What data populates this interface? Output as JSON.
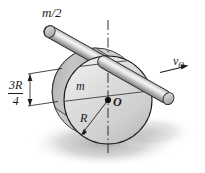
{
  "figure": {
    "name": "rolling-disk-with-rod-diagram",
    "width": 205,
    "height": 173,
    "background_color": "#ffffff"
  },
  "labels": {
    "rod_mass": "m/2",
    "disk_mass": "m",
    "center_point": "O",
    "radius": "R",
    "velocity_symbol": "v",
    "velocity_subscript": "O",
    "offset_numerator": "3R",
    "offset_denominator": "4"
  },
  "colors": {
    "disk_face": "#d3d3d3",
    "disk_face_light": "#e8e8e8",
    "disk_rim": "#b8b8b8",
    "disk_back": "#c0c0c0",
    "rod_body": "#c9c9c9",
    "rod_highlight": "#f2f2f2",
    "rod_shade": "#8f8f8f",
    "outline": "#1a1a1a",
    "shadow": "#b9b9b9",
    "background": "#ffffff"
  },
  "geometry": {
    "disk_center_x": 108,
    "disk_center_y": 100,
    "disk_radius": 44,
    "rod_offset_label": "3R/4",
    "centerline_style": "dash-dot"
  }
}
